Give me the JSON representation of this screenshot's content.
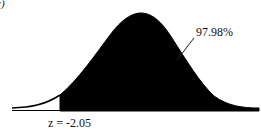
{
  "panel_label": "c)",
  "distribution": {
    "type": "normal",
    "shaded_region": "right of z",
    "z_value_label": "z = -2.05",
    "z_value": -2.05,
    "area_label": "97.98%",
    "area_percent": 97.98,
    "fill_color": "#000000",
    "curve_color": "#000000",
    "baseline_color": "#000000"
  }
}
